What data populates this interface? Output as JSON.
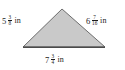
{
  "figure": {
    "type": "triangle",
    "shape_name": "scalene-triangle",
    "fill_color": "#c9c9c9",
    "stroke_color": "#6e6e6e",
    "base_stroke_color": "#4a4a4a",
    "background_color": "#ffffff"
  },
  "labels": {
    "left": {
      "name": "left-side-length",
      "whole": "5",
      "numerator": "3",
      "denominator": "8",
      "unit": "in",
      "full_text": "5 3/8 in",
      "value": 5.375
    },
    "right": {
      "name": "right-side-length",
      "whole": "6",
      "numerator": "7",
      "denominator": "16",
      "unit": "in",
      "full_text": "6 7/16 in",
      "value": 6.4375
    },
    "bottom": {
      "name": "base-side-length",
      "whole": "7",
      "numerator": "3",
      "denominator": "4",
      "unit": "in",
      "full_text": "7 3/4 in",
      "value": 7.75
    }
  },
  "geometry": {
    "apex": {
      "x": 62,
      "y": 9
    },
    "bottom_left": {
      "x": 23,
      "y": 47
    },
    "bottom_right": {
      "x": 105,
      "y": 47
    }
  }
}
